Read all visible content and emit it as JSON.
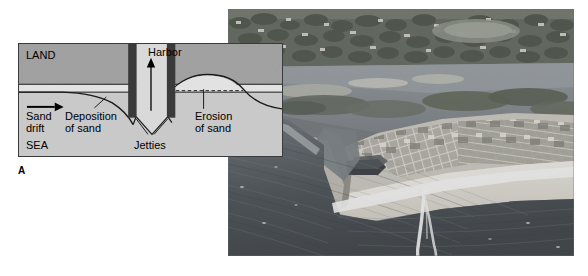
{
  "figure": {
    "panel_letter": "A",
    "caption": ""
  },
  "diagram": {
    "labels": {
      "land": "LAND",
      "sea": "SEA",
      "harbor": "Harbor",
      "sand_drift": "Sand\ndrift",
      "deposition": "Deposition\nof sand",
      "erosion": "Erosion\nof sand",
      "jetties": "Jetties"
    },
    "colors": {
      "land_fill": "#a9a9a9",
      "sea_fill": "#c9c9c9",
      "beach_fill": "#e8e8e8",
      "jetty_fill": "#3a3a3a",
      "channel_fill": "#d8d8d8",
      "line": "#1a1a1a",
      "border": "#3b3b3b"
    },
    "arrows": {
      "drift_direction": "right",
      "harbor_direction": "up"
    }
  },
  "photo": {
    "name": "aerial-photograph-of-inlet-with-jetties",
    "description": "Aerial oblique photograph of a coastal inlet showing twin jetties, a developed barrier spit with houses, a wide sand beach, an estuary/lagoon behind the spit, and a motorboat leaving a white wake in the open ocean.",
    "colors": {
      "ocean_dark": "#3c4247",
      "ocean_mid": "#5e676d",
      "lagoon": "#8d949a",
      "sand": "#e7e4dc",
      "vegetation": "#4c5048",
      "development": "#b9b7ae"
    }
  }
}
